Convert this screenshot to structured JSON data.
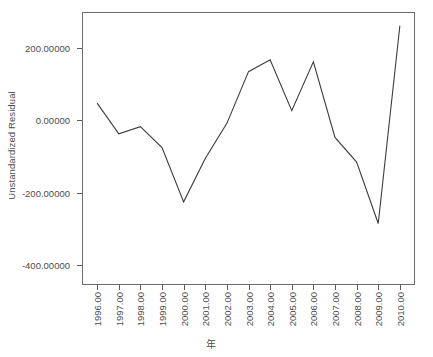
{
  "chart_data": {
    "type": "line",
    "title": "",
    "xlabel": "年",
    "ylabel": "Unstandardized Residual",
    "x": [
      1996,
      1997,
      1998,
      1999,
      2000,
      2001,
      2002,
      2003,
      2004,
      2005,
      2006,
      2007,
      2008,
      2009,
      2010
    ],
    "categories": [
      "1996.00",
      "1997.00",
      "1998.00",
      "1999.00",
      "2000.00",
      "2001.00",
      "2002.00",
      "2003.00",
      "2004.00",
      "2005.00",
      "2006.00",
      "2007.00",
      "2008.00",
      "2009.00",
      "2010.00"
    ],
    "values": [
      48,
      -37,
      -17,
      -75,
      -225,
      -105,
      -8,
      135,
      168,
      27,
      162,
      -47,
      -115,
      -285,
      262
    ],
    "series": [
      {
        "name": "Unstandardized Residual",
        "values": [
          48,
          -37,
          -17,
          -75,
          -225,
          -105,
          -8,
          135,
          168,
          27,
          162,
          -47,
          -115,
          -285,
          262
        ]
      }
    ],
    "ylim": [
      -455,
      300
    ],
    "xlim": [
      1995.3,
      2010.7
    ],
    "ytick_values": [
      200,
      0,
      -200,
      -400
    ],
    "ytick_labels": [
      "200.00000",
      "0.00000",
      "-200.00000",
      "-400.00000"
    ],
    "grid": false,
    "legend": false,
    "line_color": "#3c3c3c",
    "frame_color": "#6b6b6b",
    "text_color": "#4d4d4d",
    "background": "#ffffff",
    "markers": false
  }
}
